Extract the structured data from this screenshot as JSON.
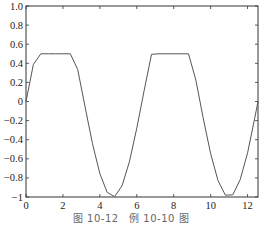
{
  "caption": "图 10-12　例 10-10 图",
  "chart_data": {
    "type": "line",
    "title": "",
    "xlabel": "",
    "ylabel": "",
    "xlim": [
      0,
      12.566
    ],
    "ylim": [
      -1,
      1
    ],
    "grid": false,
    "legend": null,
    "x_ticks": [
      0,
      2,
      4,
      6,
      8,
      10,
      12
    ],
    "x_tick_labels": [
      "0",
      "2",
      "4",
      "6",
      "8",
      "10",
      "12"
    ],
    "y_ticks": [
      1.0,
      0.8,
      0.6,
      0.4,
      0.2,
      0,
      -0.2,
      -0.4,
      -0.6,
      -0.8,
      -1
    ],
    "y_tick_labels": [
      "1.0",
      "0.8",
      "0.6",
      "0.4",
      "0.2",
      "0",
      "-0.2",
      "-0.4",
      "-0.6",
      "-0.8",
      "-1"
    ],
    "series": [
      {
        "name": "y",
        "color": "#555555",
        "x": [
          0,
          0.4,
          0.8,
          1.2,
          1.6,
          2.0,
          2.4,
          2.8,
          3.2,
          3.6,
          4.0,
          4.4,
          4.8,
          5.2,
          5.6,
          6.0,
          6.4,
          6.8,
          7.2,
          7.6,
          8.0,
          8.4,
          8.8,
          9.2,
          9.6,
          10.0,
          10.4,
          10.8,
          11.2,
          11.6,
          12.0,
          12.4,
          12.566
        ],
        "y": [
          0,
          0.389,
          0.5,
          0.5,
          0.5,
          0.5,
          0.5,
          0.335,
          -0.058,
          -0.443,
          -0.757,
          -0.952,
          -0.996,
          -0.883,
          -0.631,
          -0.279,
          0.117,
          0.494,
          0.5,
          0.5,
          0.5,
          0.5,
          0.5,
          0.223,
          -0.174,
          -0.544,
          -0.828,
          -0.981,
          -0.977,
          -0.818,
          -0.537,
          -0.165,
          0
        ]
      }
    ]
  }
}
